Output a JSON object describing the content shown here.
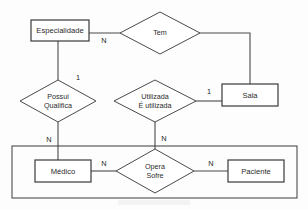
{
  "diagram": {
    "background_color": "#fdfdfd",
    "line_color": "#4a4a4a",
    "entities": [
      {
        "id": "especialidade",
        "label": "Especialidade",
        "x": 31,
        "y": 20,
        "w": 58,
        "h": 21
      },
      {
        "id": "sala",
        "label": "Sala",
        "x": 222,
        "y": 84,
        "w": 56,
        "h": 22
      },
      {
        "id": "medico",
        "label": "Médico",
        "x": 35,
        "y": 160,
        "w": 56,
        "h": 22
      },
      {
        "id": "paciente",
        "label": "Paciente",
        "x": 228,
        "y": 160,
        "w": 56,
        "h": 22
      }
    ],
    "relationships": [
      {
        "id": "tem",
        "lines": [
          "Tem"
        ],
        "cx": 160,
        "cy": 33,
        "rx": 40,
        "ry": 21
      },
      {
        "id": "possui-qualifica",
        "lines": [
          "Possui",
          "Qualifica"
        ],
        "cx": 58,
        "cy": 101,
        "rx": 38,
        "ry": 21
      },
      {
        "id": "utilizada-e-utilizada",
        "lines": [
          "Utilizada",
          "É utilizada"
        ],
        "cx": 155,
        "cy": 101,
        "rx": 41,
        "ry": 21
      },
      {
        "id": "opera-sofre",
        "lines": [
          "Opera",
          "Sofre"
        ],
        "cx": 155,
        "cy": 171,
        "rx": 39,
        "ry": 22
      }
    ],
    "group_box": {
      "id": "pessoa-group",
      "x": 12,
      "y": 146,
      "w": 285,
      "h": 52
    },
    "connectors": [
      {
        "id": "especialidade-tem",
        "points": "89,33 120,33"
      },
      {
        "id": "tem-sala",
        "points": "200,33 250,33 250,84"
      },
      {
        "id": "especialidade-possui",
        "points": "58,41 58,80"
      },
      {
        "id": "possui-medico",
        "points": "58,122 58,160"
      },
      {
        "id": "utilizada-sala",
        "points": "196,101 222,101"
      },
      {
        "id": "utilizada-opera",
        "points": "155,122 155,149"
      },
      {
        "id": "medico-opera",
        "points": "91,171 116,171"
      },
      {
        "id": "opera-paciente",
        "points": "194,171 228,171"
      }
    ],
    "cardinalities": [
      {
        "id": "card-especialidade-tem",
        "text": "N",
        "x": 104,
        "y": 41
      },
      {
        "id": "card-possui-top",
        "text": "1",
        "x": 78,
        "y": 78
      },
      {
        "id": "card-possui-bottom",
        "text": "N",
        "x": 49,
        "y": 140
      },
      {
        "id": "card-utilizada-sala",
        "text": "1",
        "x": 209,
        "y": 92
      },
      {
        "id": "card-utilizada-bottom",
        "text": "N",
        "x": 164,
        "y": 139
      },
      {
        "id": "card-medico-opera",
        "text": "N",
        "x": 104,
        "y": 164
      },
      {
        "id": "card-opera-paciente",
        "text": "N",
        "x": 211,
        "y": 164
      }
    ]
  }
}
